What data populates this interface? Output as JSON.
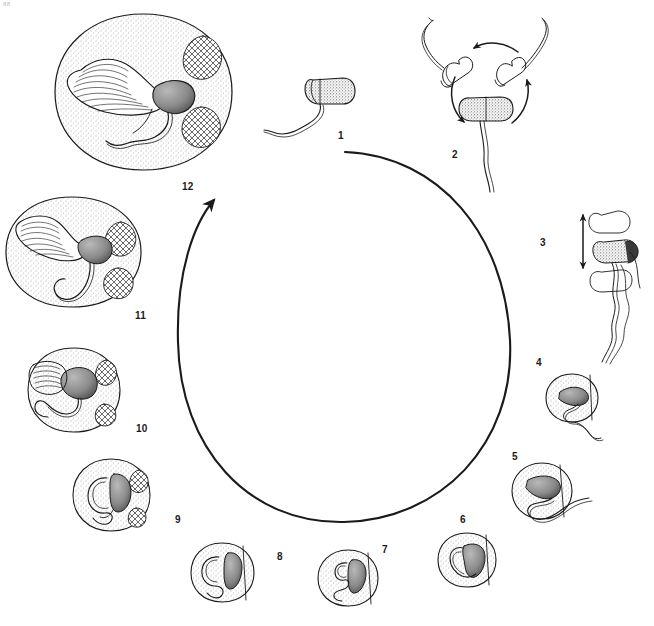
{
  "figure": {
    "background_color": "#ffffff",
    "ink_color": "#1a1a1a",
    "corner_mark": "88"
  },
  "cycle_arrow": {
    "name": "central-cycle-arrow",
    "direction": "counterclockwise",
    "center_x": 344,
    "center_y": 337,
    "radius_x": 166,
    "radius_y": 185,
    "gap_start_deg": 272,
    "gap_end_deg": 300,
    "arrowhead_at": "upper-left",
    "stroke_width": 2.0
  },
  "stages": [
    {
      "number": "1",
      "label_x": 338,
      "label_y": 131,
      "kind": "free-sperm",
      "cx": 327,
      "cy": 96,
      "description": "Free spermatozoon with stippled head and wavy flagellum"
    },
    {
      "number": "2",
      "label_x": 452,
      "label_y": 150,
      "kind": "rotating-sperm",
      "cx": 495,
      "cy": 95,
      "description": "Sperm with rotation arrows showing reorientation"
    },
    {
      "number": "3",
      "label_x": 540,
      "label_y": 238,
      "kind": "oscillating-sperm",
      "cx": 600,
      "cy": 255,
      "description": "Sperm oscillating, double-headed vertical arrow"
    },
    {
      "number": "4",
      "label_x": 536,
      "label_y": 358,
      "kind": "cell-with-sperm",
      "cx": 572,
      "cy": 398,
      "cell_rx": 26,
      "cell_ry": 24,
      "description": "Sperm head engulfed by cell, tail protruding"
    },
    {
      "number": "5",
      "label_x": 512,
      "label_y": 452,
      "kind": "cell-with-sperm",
      "cx": 542,
      "cy": 491,
      "cell_rx": 30,
      "cell_ry": 27,
      "description": "Sperm deeper inside cell, tail still external"
    },
    {
      "number": "6",
      "label_x": 460,
      "label_y": 515,
      "kind": "cell-enclosed",
      "cx": 467,
      "cy": 560,
      "cell_rx": 29,
      "cell_ry": 27,
      "description": "Sperm fully enclosed, coiled within cell"
    },
    {
      "number": "7",
      "label_x": 382,
      "label_y": 545,
      "kind": "cell-enclosed",
      "cx": 348,
      "cy": 578,
      "cell_rx": 30,
      "cell_ry": 28,
      "description": "Enclosed sperm, head vertical in cell"
    },
    {
      "number": "8",
      "label_x": 277,
      "label_y": 552,
      "kind": "cell-enclosed",
      "cx": 222,
      "cy": 573,
      "cell_rx": 31,
      "cell_ry": 29,
      "description": "Enclosed sperm with looping tail"
    },
    {
      "number": "9",
      "label_x": 175,
      "label_y": 515,
      "kind": "cell-patched",
      "cx": 111,
      "cy": 495,
      "cell_rx": 37,
      "cell_ry": 34,
      "description": "Cell enlarging, dark lysosomal patches appear"
    },
    {
      "number": "10",
      "label_x": 136,
      "label_y": 424,
      "kind": "cell-patched",
      "cx": 74,
      "cy": 390,
      "cell_rx": 45,
      "cell_ry": 41,
      "description": "Larger cell, sperm head degrading, patches on rim"
    },
    {
      "number": "11",
      "label_x": 135,
      "label_y": 311,
      "kind": "cell-crosshatch",
      "cx": 72,
      "cy": 252,
      "cell_rx": 63,
      "cell_ry": 54,
      "description": "Large cell with crosshatched bodies and striated fan"
    },
    {
      "number": "12",
      "label_x": 182,
      "label_y": 182,
      "kind": "cell-crosshatch",
      "cx": 143,
      "cy": 92,
      "cell_rx": 88,
      "cell_ry": 78,
      "description": "Largest cell, extensive striated fan and two crosshatch bodies"
    }
  ]
}
